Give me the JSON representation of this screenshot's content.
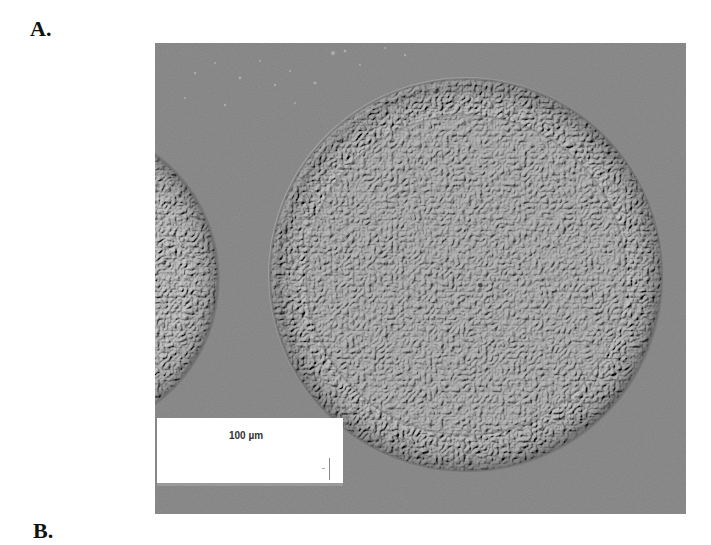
{
  "figure": {
    "panels": [
      {
        "label": "A."
      },
      {
        "label": "B."
      }
    ],
    "micrograph": {
      "description": "Circular textured object (microsphere) with partial neighbouring object at left",
      "background_color": "#8f8f8f"
    },
    "scale_bar": {
      "text": "100 µm"
    }
  }
}
